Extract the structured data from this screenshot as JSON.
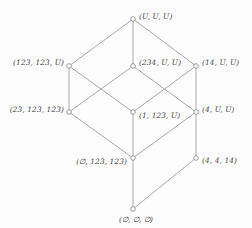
{
  "figure": {
    "type": "hasse-diagram",
    "width": 252,
    "height": 228,
    "background_color": "#fdfdfd",
    "line_color": "#9a9a9a",
    "node_stroke_color": "#8e8e8e",
    "node_fill_color": "#ffffff",
    "text_color": "#3d3d3d"
  },
  "nodes": [
    {
      "id": "top",
      "label": "(U, U, U)",
      "x": 133,
      "y": 19,
      "label_side": "right",
      "label_x": 139,
      "label_y": 17
    },
    {
      "id": "l123-123-U",
      "label": "(123, 123, U)",
      "x": 69,
      "y": 66,
      "label_side": "left",
      "label_x": 64,
      "label_y": 63
    },
    {
      "id": "l234-U-U",
      "label": "(234, U, U)",
      "x": 133,
      "y": 66,
      "label_side": "right",
      "label_x": 139,
      "label_y": 63
    },
    {
      "id": "l14-U-U",
      "label": "(14, U, U)",
      "x": 196,
      "y": 66,
      "label_side": "right",
      "label_x": 202,
      "label_y": 63
    },
    {
      "id": "l23-123-123",
      "label": "(23, 123, 123)",
      "x": 69,
      "y": 112,
      "label_side": "left",
      "label_x": 64,
      "label_y": 110
    },
    {
      "id": "l1-123-U",
      "label": "(1, 123, U)",
      "x": 133,
      "y": 112,
      "label_side": "right",
      "label_x": 139,
      "label_y": 116
    },
    {
      "id": "l4-U-U",
      "label": "(4, U, U)",
      "x": 196,
      "y": 112,
      "label_side": "right",
      "label_x": 202,
      "label_y": 110
    },
    {
      "id": "l0-123-123",
      "label": "(∅, 123, 123)",
      "x": 133,
      "y": 158,
      "label_side": "left",
      "label_x": 127,
      "label_y": 162
    },
    {
      "id": "l4-4-14",
      "label": "(4, 4, 14)",
      "x": 196,
      "y": 158,
      "label_side": "right",
      "label_x": 202,
      "label_y": 161
    },
    {
      "id": "bottom",
      "label": "(∅, ∅, ∅)",
      "x": 133,
      "y": 209,
      "label_side": "below",
      "label_x": 136,
      "label_y": 216
    }
  ],
  "edges": [
    {
      "from": "l123-123-U",
      "to": "top"
    },
    {
      "from": "l234-U-U",
      "to": "top"
    },
    {
      "from": "l14-U-U",
      "to": "top"
    },
    {
      "from": "l23-123-123",
      "to": "l123-123-U"
    },
    {
      "from": "l23-123-123",
      "to": "l234-U-U"
    },
    {
      "from": "l1-123-U",
      "to": "l123-123-U"
    },
    {
      "from": "l1-123-U",
      "to": "l14-U-U"
    },
    {
      "from": "l4-U-U",
      "to": "l234-U-U"
    },
    {
      "from": "l4-U-U",
      "to": "l14-U-U"
    },
    {
      "from": "l0-123-123",
      "to": "l23-123-123"
    },
    {
      "from": "l0-123-123",
      "to": "l1-123-U"
    },
    {
      "from": "l0-123-123",
      "to": "l4-U-U"
    },
    {
      "from": "bottom",
      "to": "l0-123-123"
    },
    {
      "from": "bottom",
      "to": "l4-4-14"
    },
    {
      "from": "l4-4-14",
      "to": "l4-U-U"
    }
  ]
}
